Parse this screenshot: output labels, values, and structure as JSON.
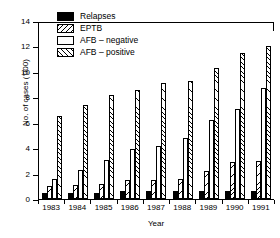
{
  "chart_data": {
    "type": "bar",
    "title": "",
    "xlabel": "Year",
    "ylabel": "No. of cases ('000)",
    "ylim": [
      0,
      14
    ],
    "yticks": [
      0,
      2,
      4,
      6,
      8,
      10,
      12,
      14
    ],
    "grid": false,
    "legend_position": "top-left",
    "categories": [
      "1983",
      "1984",
      "1985",
      "1986",
      "1987",
      "1988",
      "1989",
      "1990",
      "1991"
    ],
    "series": [
      {
        "name": "Relapses",
        "pattern": "solid-black",
        "values": [
          0.5,
          0.5,
          0.5,
          0.6,
          0.6,
          0.6,
          0.6,
          0.6,
          0.6
        ]
      },
      {
        "name": "EPTB",
        "pattern": "hatch-back",
        "values": [
          1.0,
          1.1,
          1.2,
          1.5,
          1.5,
          1.6,
          2.2,
          2.9,
          3.0
        ]
      },
      {
        "name": "AFB – negative",
        "pattern": "open-white",
        "values": [
          1.6,
          2.3,
          3.1,
          3.9,
          4.2,
          4.8,
          6.2,
          7.1,
          8.7
        ]
      },
      {
        "name": "AFB – positive",
        "pattern": "hatch-forward",
        "values": [
          6.5,
          7.4,
          8.2,
          8.6,
          9.1,
          9.3,
          10.3,
          11.5,
          12.0
        ]
      }
    ]
  },
  "legend": {
    "items": [
      {
        "label": "Relapses"
      },
      {
        "label": "EPTB"
      },
      {
        "label": "AFB – negative"
      },
      {
        "label": "AFB – positive"
      }
    ]
  },
  "colors": {
    "ink": "#000000",
    "background": "#ffffff"
  }
}
